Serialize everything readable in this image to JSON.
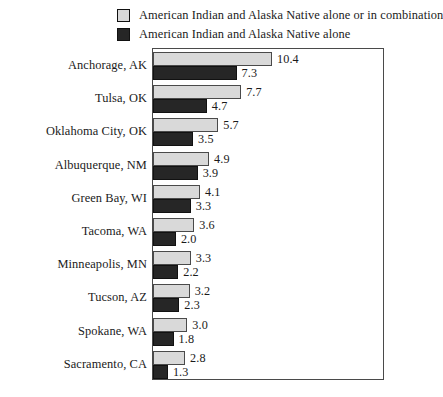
{
  "legend": {
    "items": [
      {
        "label": "American Indian and Alaska Native alone or in combination",
        "swatch": "light-gray-swatch",
        "color": "#d9d9d9"
      },
      {
        "label": "American Indian  and Alaska Native alone",
        "swatch": "dark-swatch",
        "color": "#262626"
      }
    ]
  },
  "chart_data": {
    "type": "bar",
    "orientation": "horizontal",
    "title": "",
    "subtitle": "",
    "xlabel": "",
    "ylabel": "",
    "grid": false,
    "legend_position": "top",
    "xlim": [
      0,
      10.4
    ],
    "categories": [
      "Anchorage, AK",
      "Tulsa, OK",
      "Oklahoma City, OK",
      "Albuquerque, NM",
      "Green Bay, WI",
      "Tacoma, WA",
      "Minneapolis, MN",
      "Tucson, AZ",
      "Spokane, WA",
      "Sacramento, CA"
    ],
    "series": [
      {
        "name": "American Indian and Alaska Native alone or in combination",
        "color": "#d9d9d9",
        "values": [
          10.4,
          7.7,
          5.7,
          4.9,
          4.1,
          3.6,
          3.3,
          3.2,
          3.0,
          2.8
        ],
        "labels": [
          "10.4",
          "7.7",
          "5.7",
          "4.9",
          "4.1",
          "3.6",
          "3.3",
          "3.2",
          "3.0",
          "2.8"
        ]
      },
      {
        "name": "American Indian  and Alaska Native alone",
        "color": "#262626",
        "values": [
          7.3,
          4.7,
          3.5,
          3.9,
          3.3,
          2.0,
          2.2,
          2.3,
          1.8,
          1.3
        ],
        "labels": [
          "7.3",
          "4.7",
          "3.5",
          "3.9",
          "3.3",
          "2.0",
          "2.2",
          "2.3",
          "1.8",
          "1.3"
        ]
      }
    ]
  }
}
